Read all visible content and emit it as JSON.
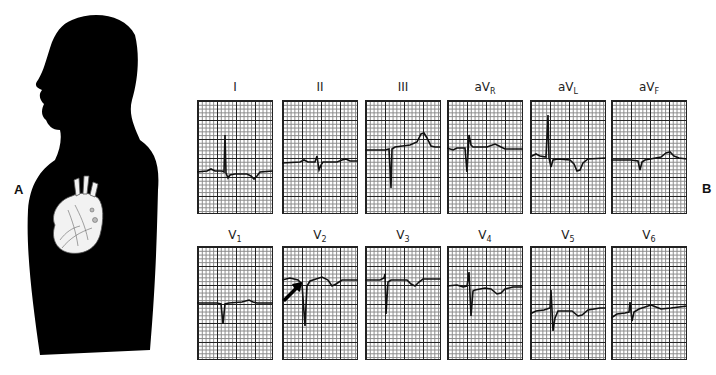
{
  "figure": {
    "label_a": "A",
    "label_b": "B",
    "illustration": "human-torso-silhouette-with-heart",
    "limb_leads": [
      {
        "name": "I",
        "sub": ""
      },
      {
        "name": "II",
        "sub": ""
      },
      {
        "name": "III",
        "sub": ""
      },
      {
        "name": "aV",
        "sub": "R"
      },
      {
        "name": "aV",
        "sub": "L"
      },
      {
        "name": "aV",
        "sub": "F"
      }
    ],
    "precordial_leads": [
      {
        "name": "V",
        "sub": "1"
      },
      {
        "name": "V",
        "sub": "2"
      },
      {
        "name": "V",
        "sub": "3"
      },
      {
        "name": "V",
        "sub": "4"
      },
      {
        "name": "V",
        "sub": "5"
      },
      {
        "name": "V",
        "sub": "6"
      }
    ],
    "annotation": "arrow pointing to QRS in V2"
  }
}
